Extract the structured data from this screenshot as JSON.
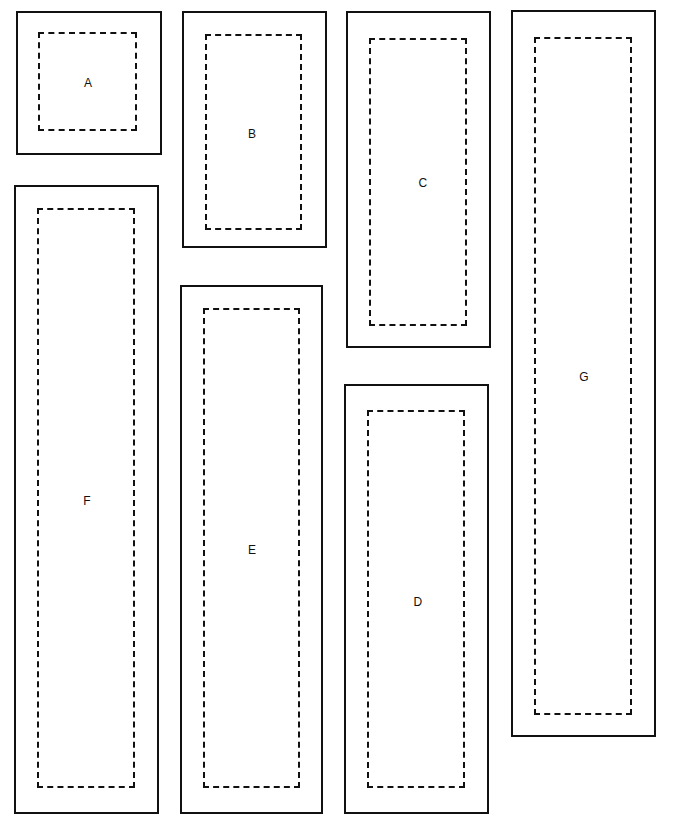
{
  "diagram": {
    "background_color": "#ffffff",
    "stroke_color": "#111111",
    "canvas": {
      "width": 677,
      "height": 832
    },
    "shapes": [
      {
        "id": "shape-a",
        "label": "A",
        "outer": {
          "x": 16,
          "y": 11,
          "width": 146,
          "height": 144
        },
        "inner": {
          "x": 38,
          "y": 32,
          "width": 99,
          "height": 99
        },
        "label_pos": {
          "x": 88,
          "y": 83
        }
      },
      {
        "id": "shape-b",
        "label": "B",
        "outer": {
          "x": 182,
          "y": 11,
          "width": 145,
          "height": 237
        },
        "inner": {
          "x": 205,
          "y": 34,
          "width": 97,
          "height": 196
        },
        "label_pos": {
          "x": 252,
          "y": 134
        }
      },
      {
        "id": "shape-c",
        "label": "C",
        "outer": {
          "x": 346,
          "y": 11,
          "width": 145,
          "height": 337
        },
        "inner": {
          "x": 369,
          "y": 38,
          "width": 98,
          "height": 288
        },
        "label_pos": {
          "x": 423,
          "y": 183
        }
      },
      {
        "id": "shape-g",
        "label": "G",
        "outer": {
          "x": 511,
          "y": 10,
          "width": 145,
          "height": 727
        },
        "inner": {
          "x": 534,
          "y": 37,
          "width": 98,
          "height": 678
        },
        "label_pos": {
          "x": 584,
          "y": 377
        }
      },
      {
        "id": "shape-f",
        "label": "F",
        "outer": {
          "x": 14,
          "y": 185,
          "width": 145,
          "height": 629
        },
        "inner": {
          "x": 37,
          "y": 208,
          "width": 98,
          "height": 580
        },
        "label_pos": {
          "x": 87,
          "y": 501
        }
      },
      {
        "id": "shape-e",
        "label": "E",
        "outer": {
          "x": 180,
          "y": 285,
          "width": 143,
          "height": 529
        },
        "inner": {
          "x": 203,
          "y": 308,
          "width": 97,
          "height": 480
        },
        "label_pos": {
          "x": 252,
          "y": 550
        }
      },
      {
        "id": "shape-d",
        "label": "D",
        "outer": {
          "x": 344,
          "y": 384,
          "width": 145,
          "height": 430
        },
        "inner": {
          "x": 367,
          "y": 410,
          "width": 98,
          "height": 378
        },
        "label_pos": {
          "x": 418,
          "y": 602
        }
      }
    ]
  }
}
